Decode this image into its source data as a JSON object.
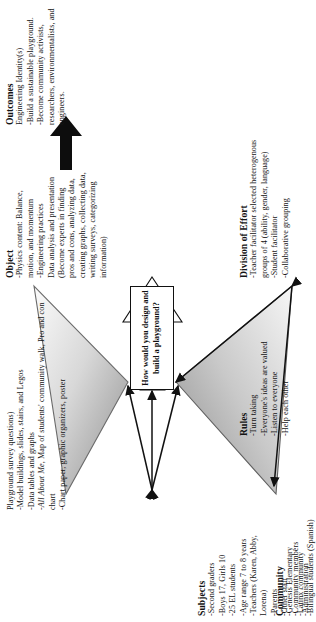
{
  "figure": {
    "type": "activity-system-triangle",
    "center_question": "How would you design and build a playground?"
  },
  "nodes": {
    "tools": {
      "title": "",
      "body": "Playground survey questions)\n-Model buildings, slides, stairs, and Legos\n-Data tables and graphs\n-All About Me, Map of students' community walk, Pro and con chart\n-Chart paper, graphic organizers, poster",
      "italic_phrase": "All About Me"
    },
    "subjects": {
      "title": "Subjects",
      "body": "-Second graders\n-Boys 17, Girls 10\n-25 EL students\n-Age range 7 to 8 years\n-Teachers (Karen, Abby, Lorena)\n-Parents\n-Other staff\n-Community members\n-Administration"
    },
    "object": {
      "title": "Object",
      "body": "-Physics content: Balance, motion, and momentum\n-Engineering practices\nData analysis and presentation (Become experts in finding pros and cons, analyzing data, creating graphs, collecting data, writing surveys, categorizing information)"
    },
    "outcomes": {
      "title": "Outcomes",
      "body": "Engineering Identity(s)\n-Build a sustainable playground.\n-Become community activists, researchers, environmentalists, and engineers."
    },
    "rules": {
      "title": "Rules",
      "body": "-Turn taking\n-Everyone's ideas are valued\n-Listen to everyone\n-Help each other"
    },
    "community": {
      "title": "Community",
      "body": "-Genesis Elementary\n-Latinx community\n-Bilingual students (Spanish)"
    },
    "division": {
      "title": "Division of Effort",
      "body": "-Teacher facilitator selected heterogenous groups of 4 (ability, gender, language)\n-Student facilitator\n-Collaborative grouping"
    }
  },
  "colors": {
    "ink": "#141414",
    "fill_light": "#f2f2f2",
    "fill_dark": "#9a9a9a",
    "stroke": "#111111"
  }
}
